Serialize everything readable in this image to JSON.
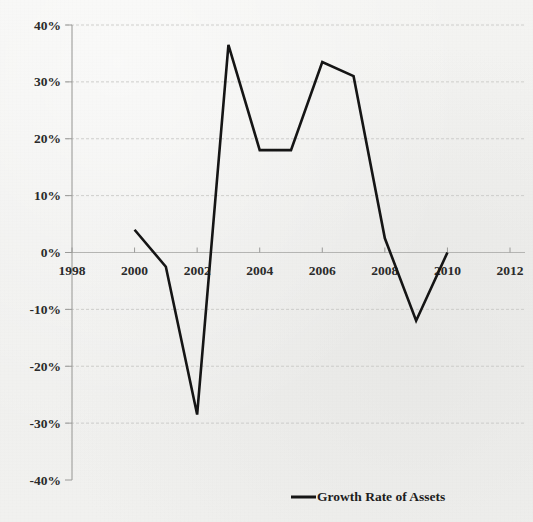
{
  "chart_data": {
    "type": "line",
    "title": "",
    "xlabel": "",
    "ylabel": "",
    "grid": true,
    "legend_position": "bottom-right",
    "xlim": [
      1998,
      2012
    ],
    "ylim": [
      -40,
      40
    ],
    "x_ticks": [
      "1998",
      "2000",
      "2002",
      "2004",
      "2006",
      "2008",
      "2010",
      "2012"
    ],
    "x_tick_values": [
      1998,
      2000,
      2002,
      2004,
      2006,
      2008,
      2010,
      2012
    ],
    "y_ticks": [
      "40%",
      "30%",
      "20%",
      "10%",
      "0%",
      "-10%",
      "-20%",
      "-30%",
      "-40%"
    ],
    "y_tick_values": [
      40,
      30,
      20,
      10,
      0,
      -10,
      -20,
      -30,
      -40
    ],
    "series": [
      {
        "name": "Growth Rate of Assets",
        "color": "#151515",
        "x": [
          2000,
          2001,
          2002,
          2003,
          2004,
          2005,
          2006,
          2007,
          2008,
          2009,
          2010
        ],
        "values": [
          4,
          -2.5,
          -28.5,
          36.5,
          18,
          18,
          33.5,
          31,
          2.5,
          -12,
          0
        ]
      }
    ]
  },
  "legend": {
    "entries": [
      {
        "label": "Growth Rate of Assets",
        "color": "#151515"
      }
    ]
  }
}
